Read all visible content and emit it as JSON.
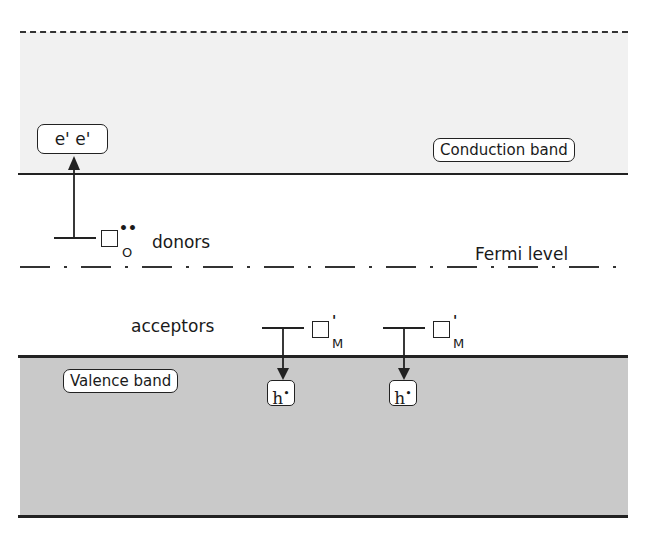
{
  "diagram": {
    "bands": {
      "conduction": "Conduction band",
      "valence": "Valence band"
    },
    "fermi_level": "Fermi level",
    "donors": {
      "label": "donors",
      "defect_subscript": "O",
      "defect_superscript": "••",
      "electrons": "e'   e'"
    },
    "acceptors": {
      "label": "acceptors",
      "defects": [
        {
          "subscript": "M",
          "superscript": "'",
          "hole": "h",
          "hole_sup": "•"
        },
        {
          "subscript": "M",
          "superscript": "'",
          "hole": "h",
          "hole_sup": "•"
        }
      ]
    },
    "colors": {
      "conduction_band_fill": "#f1f1f1",
      "valence_band_fill": "#c9c9c9",
      "line": "#222222"
    }
  }
}
